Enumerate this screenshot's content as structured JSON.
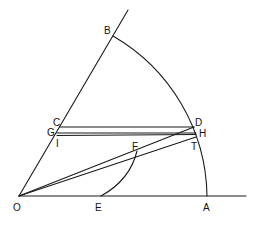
{
  "diagram": {
    "type": "geometric-construction",
    "points": {
      "O": {
        "label": "O",
        "x": 19,
        "y": 196
      },
      "A": {
        "label": "A",
        "x": 207,
        "y": 196
      },
      "E": {
        "label": "E",
        "x": 101,
        "y": 196
      },
      "B": {
        "label": "B",
        "x": 113,
        "y": 36
      },
      "C": {
        "label": "C",
        "x": 60,
        "y": 127
      },
      "D": {
        "label": "D",
        "x": 194,
        "y": 127
      },
      "G": {
        "label": "G",
        "x": 57,
        "y": 133
      },
      "H": {
        "label": "H",
        "x": 196,
        "y": 133
      },
      "I": {
        "label": "I",
        "x": 56,
        "y": 135
      },
      "T": {
        "label": "T",
        "x": 195,
        "y": 138
      },
      "F": {
        "label": "F",
        "x": 137,
        "y": 151
      }
    },
    "segments": [
      "O-baseline",
      "O-ray",
      "C-D",
      "G-H",
      "I-H",
      "O-D",
      "O-T",
      "A-up"
    ],
    "arcs": [
      "B-A (center O)",
      "E-F"
    ],
    "stroke_color": "#1a1a1a",
    "background": "#ffffff"
  }
}
